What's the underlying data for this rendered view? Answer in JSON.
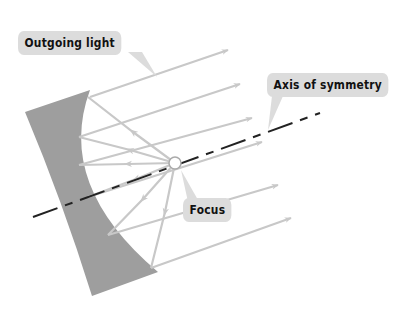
{
  "diagram": {
    "labels": {
      "outgoing_light": "Outgoing light",
      "axis_of_symmetry": "Axis of symmetry",
      "focus": "Focus"
    },
    "colors": {
      "mirror": "#9e9e9e",
      "rays": "#c8c8c8",
      "axis": "#222222",
      "label_bg": "#dcdcdc",
      "label_text": "#111111",
      "focus_fill": "#ffffff",
      "focus_stroke": "#aaaaaa"
    },
    "focus_point": {
      "x": 175,
      "y": 163
    },
    "axis_line": {
      "x1": 33,
      "y1": 217,
      "x2": 320,
      "y2": 113,
      "style": "dashed"
    },
    "ray_count": 7
  }
}
